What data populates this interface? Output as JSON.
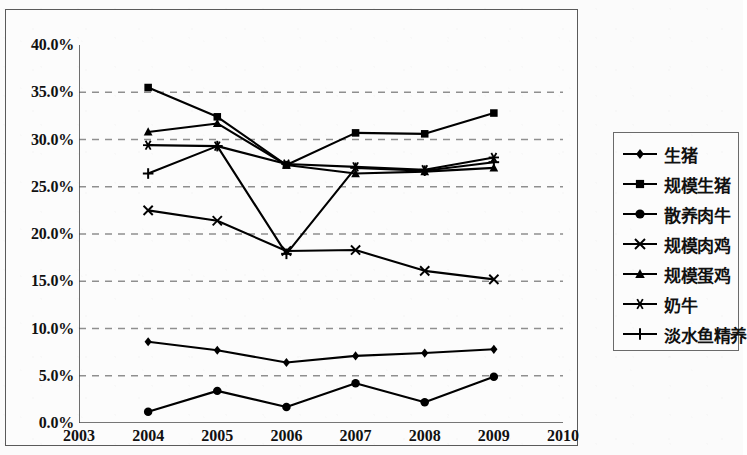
{
  "chart_data": {
    "type": "line",
    "title": "",
    "xlabel": "",
    "ylabel": "",
    "x": [
      2004,
      2005,
      2006,
      2007,
      2008,
      2009
    ],
    "xlim": [
      2003,
      2010
    ],
    "x_ticks": [
      "2003",
      "2004",
      "2005",
      "2006",
      "2007",
      "2008",
      "2009",
      "2010"
    ],
    "ylim": [
      0,
      40
    ],
    "y_ticks": [
      "0.0%",
      "5.0%",
      "10.0%",
      "15.0%",
      "20.0%",
      "25.0%",
      "30.0%",
      "35.0%",
      "40.0%"
    ],
    "y_tick_values": [
      0,
      5,
      10,
      15,
      20,
      25,
      30,
      35,
      40
    ],
    "grid": "horizontal-dashed",
    "legend_position": "right-outside",
    "series": [
      {
        "name": "生猪",
        "marker": "diamond",
        "values": [
          8.6,
          7.7,
          6.4,
          7.1,
          7.4,
          7.8
        ]
      },
      {
        "name": "规模生猪",
        "marker": "square",
        "values": [
          35.5,
          32.4,
          27.3,
          30.7,
          30.6,
          32.8
        ]
      },
      {
        "name": "散养肉牛",
        "marker": "circle",
        "values": [
          1.2,
          3.4,
          1.7,
          4.2,
          2.2,
          4.9
        ]
      },
      {
        "name": "规模肉鸡",
        "marker": "cross-x",
        "values": [
          22.5,
          21.4,
          18.2,
          18.3,
          16.1,
          15.2
        ]
      },
      {
        "name": "规模蛋鸡",
        "marker": "triangle",
        "values": [
          30.8,
          31.7,
          27.3,
          26.4,
          26.6,
          27.0
        ]
      },
      {
        "name": "奶牛",
        "marker": "asterisk",
        "values": [
          29.4,
          29.3,
          27.4,
          27.1,
          26.8,
          28.1
        ]
      },
      {
        "name": "淡水鱼精养",
        "marker": "plus",
        "values": [
          26.4,
          29.3,
          17.9,
          27.0,
          26.7,
          27.6
        ]
      }
    ]
  },
  "legend": {
    "items": [
      {
        "label": "生猪",
        "marker": "diamond"
      },
      {
        "label": "规模生猪",
        "marker": "square"
      },
      {
        "label": "散养肉牛",
        "marker": "circle"
      },
      {
        "label": "规模肉鸡",
        "marker": "cross-x"
      },
      {
        "label": "规模蛋鸡",
        "marker": "triangle"
      },
      {
        "label": "奶牛",
        "marker": "asterisk"
      },
      {
        "label": "淡水鱼精养",
        "marker": "plus"
      }
    ]
  },
  "colors": {
    "line": "#000000",
    "grid": "#8f8f8f",
    "axis": "#4a4a4a",
    "text": "#111111",
    "background": "#fbfbfb"
  }
}
